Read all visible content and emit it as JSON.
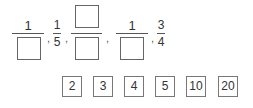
{
  "sequence": {
    "items": [
      {
        "type": "fraction",
        "numerator": "1",
        "denominator": ""
      },
      {
        "type": "fraction",
        "numerator": "1",
        "denominator": "5"
      },
      {
        "type": "fraction",
        "numerator": "",
        "denominator": ""
      },
      {
        "type": "fraction",
        "numerator": "1",
        "denominator": ""
      },
      {
        "type": "fraction",
        "numerator": "3",
        "denominator": "4"
      }
    ],
    "separator": ","
  },
  "choices": [
    "2",
    "3",
    "4",
    "5",
    "10",
    "20"
  ]
}
